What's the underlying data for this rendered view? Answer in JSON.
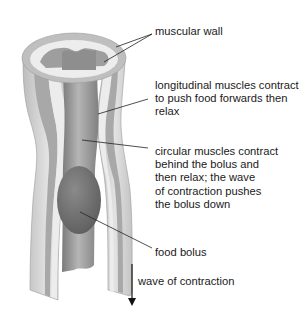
{
  "diagram": {
    "labels": {
      "muscular_wall": "muscular wall",
      "longitudinal": "longitudinal muscles contract\nto push food forwards then\nrelax",
      "circular": "circular muscles contract\nbehind the bolus and\nthen relax; the wave\nof contraction pushes\nthe bolus down",
      "food_bolus": "food bolus",
      "wave": "wave of contraction"
    },
    "colors": {
      "outer_wall": "#c8c8c8",
      "muscle_band": "#a9a9a9",
      "inner_lining": "#e6e6e6",
      "lumen": "#8c8c8c",
      "bolus": "#6e6e6e",
      "leader_line": "#222222"
    }
  }
}
